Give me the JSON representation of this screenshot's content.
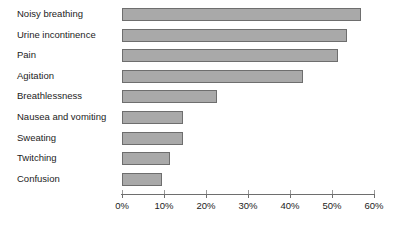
{
  "chart_data": {
    "type": "bar",
    "orientation": "horizontal",
    "title": "",
    "subtitle": "",
    "xlabel": "",
    "ylabel": "",
    "categories": [
      "Noisy breathing",
      "Urine incontinence",
      "Pain",
      "Agitation",
      "Breathlessness",
      "Nausea and vomiting",
      "Sweating",
      "Twitching",
      "Confusion"
    ],
    "values": [
      57,
      53.5,
      51.5,
      43,
      22.5,
      14.5,
      14.5,
      11.5,
      9.5
    ],
    "value_unit": "%",
    "xlim": [
      0,
      60
    ],
    "xticks": [
      0,
      10,
      20,
      30,
      40,
      50,
      60
    ],
    "xtick_labels": [
      "0%",
      "10%",
      "20%",
      "30%",
      "40%",
      "50%",
      "60%"
    ],
    "grid": false,
    "legend": null,
    "bar_color": "#a9a9a9",
    "bar_border_color": "#6e6e6e",
    "axis_color": "#6e6e6e",
    "background": "#ffffff"
  }
}
